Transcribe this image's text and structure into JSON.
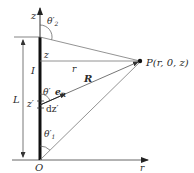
{
  "diagram": {
    "type": "physics-geometry",
    "axes": {
      "z_label": "z",
      "r_label": "r",
      "origin_label": "O"
    },
    "wire": {
      "current_label": "I",
      "length_label": "L"
    },
    "labels": {
      "theta2": "θ′",
      "theta2_sub": "2",
      "theta1": "θ′",
      "theta1_sub": "1",
      "theta": "θ′",
      "z_level": "z",
      "r_distance": "r",
      "R_vector": "R",
      "eR": "e",
      "eR_sub": "R",
      "z_prime": "z′",
      "dz_prime": "dz′",
      "point_P": "P(r, 0, z)"
    },
    "colors": {
      "line": "#555555",
      "wire": "#111111",
      "text": "#2a2a2a"
    }
  }
}
